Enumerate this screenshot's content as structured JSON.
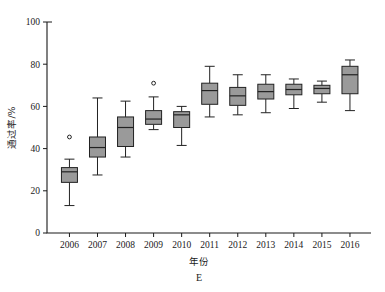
{
  "chart_data": {
    "type": "box",
    "title": "",
    "xlabel": "年份",
    "ylabel": "通过率/%",
    "figure_label": "E",
    "categories": [
      "2006",
      "2007",
      "2008",
      "2009",
      "2010",
      "2011",
      "2012",
      "2013",
      "2014",
      "2015",
      "2016"
    ],
    "ylim": [
      0,
      100
    ],
    "yticks": [
      0,
      20,
      40,
      60,
      80,
      100
    ],
    "grid": false,
    "legend": "none",
    "box_fill_color": "#9a9a9a",
    "box_line_color": "#222222",
    "boxes": [
      {
        "category": "2006",
        "whisker_low": 13.0,
        "q1": 24.0,
        "median": 29.0,
        "q3": 31.0,
        "whisker_high": 35.0,
        "outliers": [
          45.5
        ]
      },
      {
        "category": "2007",
        "whisker_low": 27.5,
        "q1": 36.0,
        "median": 40.5,
        "q3": 45.5,
        "whisker_high": 64.0,
        "outliers": []
      },
      {
        "category": "2008",
        "whisker_low": 36.0,
        "q1": 41.0,
        "median": 50.0,
        "q3": 55.0,
        "whisker_high": 62.5,
        "outliers": []
      },
      {
        "category": "2009",
        "whisker_low": 49.0,
        "q1": 51.5,
        "median": 54.0,
        "q3": 58.0,
        "whisker_high": 64.5,
        "outliers": [
          71.0
        ]
      },
      {
        "category": "2010",
        "whisker_low": 41.5,
        "q1": 50.0,
        "median": 56.0,
        "q3": 57.5,
        "whisker_high": 60.0,
        "outliers": []
      },
      {
        "category": "2011",
        "whisker_low": 55.0,
        "q1": 61.0,
        "median": 67.5,
        "q3": 71.0,
        "whisker_high": 79.0,
        "outliers": []
      },
      {
        "category": "2012",
        "whisker_low": 56.0,
        "q1": 60.5,
        "median": 65.0,
        "q3": 69.0,
        "whisker_high": 75.0,
        "outliers": []
      },
      {
        "category": "2013",
        "whisker_low": 57.0,
        "q1": 63.5,
        "median": 67.0,
        "q3": 70.5,
        "whisker_high": 75.0,
        "outliers": []
      },
      {
        "category": "2014",
        "whisker_low": 59.0,
        "q1": 65.5,
        "median": 68.0,
        "q3": 70.5,
        "whisker_high": 73.0,
        "outliers": []
      },
      {
        "category": "2015",
        "whisker_low": 62.0,
        "q1": 66.0,
        "median": 68.5,
        "q3": 70.0,
        "whisker_high": 72.0,
        "outliers": []
      },
      {
        "category": "2016",
        "whisker_low": 58.0,
        "q1": 66.0,
        "median": 75.0,
        "q3": 79.0,
        "whisker_high": 82.0,
        "outliers": []
      }
    ]
  },
  "axis": {
    "y_tick_labels": [
      "100",
      "80",
      "60",
      "40",
      "20",
      "0"
    ],
    "x_tick_labels": [
      "2006",
      "2007",
      "2008",
      "2009",
      "2010",
      "2011",
      "2012",
      "2013",
      "2014",
      "2015",
      "2016"
    ],
    "y_title": "通过率/%",
    "x_title": "年份"
  },
  "figure": {
    "panel_label": "E"
  }
}
